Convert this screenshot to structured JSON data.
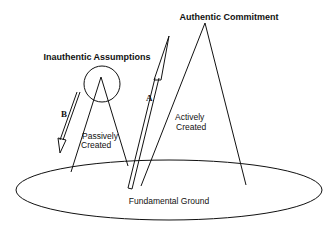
{
  "diagram": {
    "labels": {
      "authentic_commitment": "Authentic Commitment",
      "inauthentic_assumptions": "Inauthentic Assumptions",
      "passively_line1": "Passively",
      "passively_line2": "Created",
      "actively_line1": "Actively",
      "actively_line2": "Created",
      "fundamental_ground": "Fundamental Ground",
      "arrow_a": "A",
      "arrow_b": "B"
    },
    "colors": {
      "stroke": "#111111",
      "background": "#ffffff"
    }
  }
}
